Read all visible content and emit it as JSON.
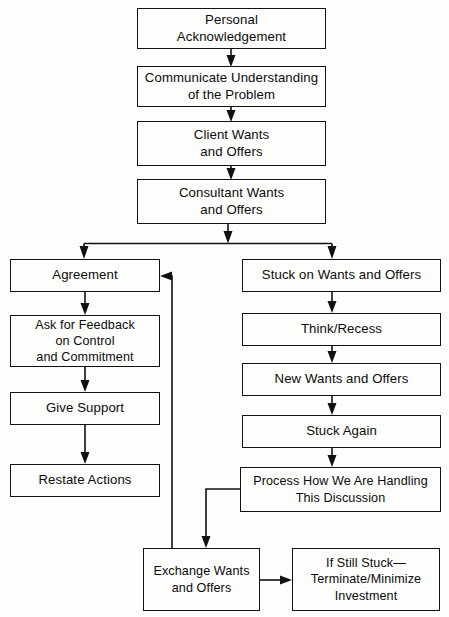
{
  "diagram": {
    "background_color": "#fdfdfc",
    "line_color": "#111111",
    "text_color": "#0b0b0b",
    "nodes": [
      {
        "id": "personal_acknowledgement",
        "label": "Personal\nAcknowledgement",
        "x": 137,
        "y": 8,
        "w": 189,
        "h": 41
      },
      {
        "id": "communicate_understanding",
        "label": "Communicate Understanding\nof the Problem",
        "x": 137,
        "y": 66,
        "w": 189,
        "h": 41
      },
      {
        "id": "client_wants",
        "label": "Client Wants\nand Offers",
        "x": 137,
        "y": 121,
        "w": 189,
        "h": 45
      },
      {
        "id": "consultant_wants",
        "label": "Consultant Wants\nand Offers",
        "x": 137,
        "y": 179,
        "w": 189,
        "h": 45
      },
      {
        "id": "agreement",
        "label": "Agreement",
        "x": 10,
        "y": 259,
        "w": 150,
        "h": 33
      },
      {
        "id": "stuck_on_wants",
        "label": "Stuck on Wants and Offers",
        "x": 242,
        "y": 259,
        "w": 199,
        "h": 33
      },
      {
        "id": "ask_for_feedback",
        "label": "Ask for Feedback\non  Control\nand Commitment",
        "x": 10,
        "y": 315,
        "w": 150,
        "h": 52
      },
      {
        "id": "think_recess",
        "label": "Think/Recess",
        "x": 242,
        "y": 313,
        "w": 199,
        "h": 33
      },
      {
        "id": "give_support",
        "label": "Give Support",
        "x": 10,
        "y": 392,
        "w": 150,
        "h": 33
      },
      {
        "id": "new_wants",
        "label": "New Wants and Offers",
        "x": 242,
        "y": 363,
        "w": 199,
        "h": 33
      },
      {
        "id": "restate_actions",
        "label": "Restate Actions",
        "x": 10,
        "y": 464,
        "w": 150,
        "h": 33
      },
      {
        "id": "stuck_again",
        "label": "Stuck Again",
        "x": 242,
        "y": 415,
        "w": 199,
        "h": 33
      },
      {
        "id": "process_how",
        "label": "Process How We Are Handling\nThis Discussion",
        "x": 240,
        "y": 467,
        "w": 201,
        "h": 45
      },
      {
        "id": "exchange_wants",
        "label": "Exchange Wants\nand Offers",
        "x": 143,
        "y": 548,
        "w": 117,
        "h": 63
      },
      {
        "id": "if_still_stuck",
        "label": "If Still Stuck—\nTerminate/Minimize\nInvestment",
        "x": 292,
        "y": 548,
        "w": 148,
        "h": 63
      }
    ],
    "edges": [
      {
        "id": "e-personal-communicate",
        "from": "personal_acknowledgement",
        "to": "communicate_understanding",
        "kind": "vertical-arrow"
      },
      {
        "id": "e-communicate-client",
        "from": "communicate_understanding",
        "to": "client_wants",
        "kind": "vertical-arrow"
      },
      {
        "id": "e-client-consultant",
        "from": "client_wants",
        "to": "consultant_wants",
        "kind": "vertical-arrow"
      },
      {
        "id": "e-consultant-split",
        "from": "consultant_wants",
        "to": "split-bar",
        "kind": "vertical-arrow"
      },
      {
        "id": "e-split-agreement",
        "from": "split-bar",
        "to": "agreement",
        "kind": "branch-arrow"
      },
      {
        "id": "e-split-stuck",
        "from": "split-bar",
        "to": "stuck_on_wants",
        "kind": "branch-arrow"
      },
      {
        "id": "e-agreement-feedback",
        "from": "agreement",
        "to": "ask_for_feedback",
        "kind": "vertical-arrow"
      },
      {
        "id": "e-feedback-support",
        "from": "ask_for_feedback",
        "to": "give_support",
        "kind": "vertical-arrow"
      },
      {
        "id": "e-support-restate",
        "from": "give_support",
        "to": "restate_actions",
        "kind": "vertical-arrow"
      },
      {
        "id": "e-stuck-think",
        "from": "stuck_on_wants",
        "to": "think_recess",
        "kind": "vertical-arrow"
      },
      {
        "id": "e-think-new",
        "from": "think_recess",
        "to": "new_wants",
        "kind": "vertical-arrow"
      },
      {
        "id": "e-new-stuckagain",
        "from": "new_wants",
        "to": "stuck_again",
        "kind": "vertical-arrow"
      },
      {
        "id": "e-stuckagain-process",
        "from": "stuck_again",
        "to": "process_how",
        "kind": "vertical-arrow"
      },
      {
        "id": "e-process-exchange",
        "from": "process_how",
        "to": "exchange_wants",
        "kind": "elbow-arrow"
      },
      {
        "id": "e-exchange-agreement",
        "from": "exchange_wants",
        "to": "agreement",
        "kind": "feedback-loop-arrow"
      },
      {
        "id": "e-exchange-stillstuck",
        "from": "exchange_wants",
        "to": "if_still_stuck",
        "kind": "horizontal-arrow"
      }
    ]
  }
}
